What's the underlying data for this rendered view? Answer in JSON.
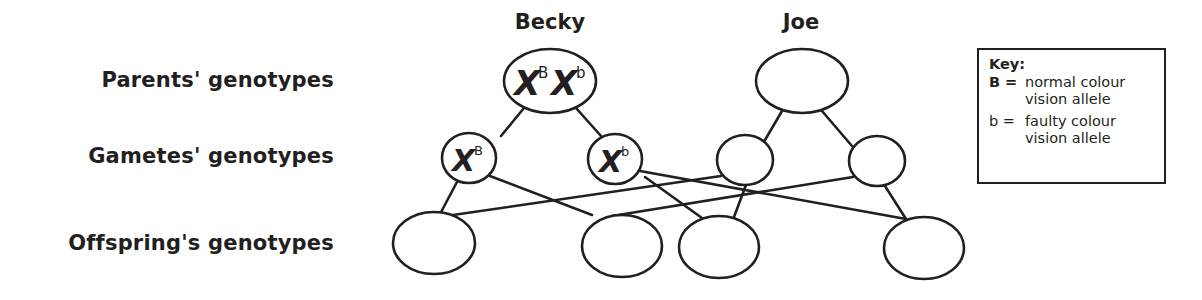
{
  "row_labels": {
    "parents": "Parents' genotypes",
    "gametes": "Gametes' genotypes",
    "offspring": "Offspring's genotypes"
  },
  "parents": [
    {
      "name": "Becky",
      "genotype": [
        {
          "base": "X",
          "sup": "B"
        },
        {
          "base": "X",
          "sup": "b"
        }
      ]
    },
    {
      "name": "Joe",
      "genotype": []
    }
  ],
  "gametes": [
    {
      "parent": "Becky",
      "base": "X",
      "sup": "B"
    },
    {
      "parent": "Becky",
      "base": "X",
      "sup": "b"
    },
    {
      "parent": "Joe",
      "base": "",
      "sup": ""
    },
    {
      "parent": "Joe",
      "base": "",
      "sup": ""
    }
  ],
  "offspring": [
    {
      "genotype": ""
    },
    {
      "genotype": ""
    },
    {
      "genotype": ""
    },
    {
      "genotype": ""
    }
  ],
  "key": {
    "title": "Key:",
    "entries": [
      {
        "symbol": "B =",
        "line1": "normal colour",
        "line2": "vision allele"
      },
      {
        "symbol": "b =",
        "line1": "faulty colour",
        "line2": "vision allele"
      }
    ]
  },
  "colors": {
    "ink": "#231f20",
    "background": "#ffffff"
  }
}
